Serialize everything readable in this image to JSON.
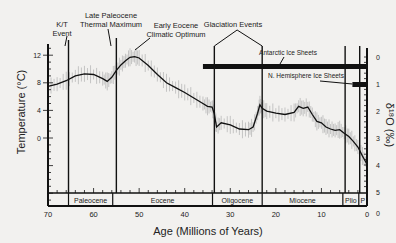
{
  "chart_data": {
    "type": "line",
    "title": "",
    "xlabel": "Age (Millions of Years)",
    "ylabel": "Temperature (°C)",
    "ylabel_right": "δ18O (‰)",
    "xlim": [
      70,
      0
    ],
    "ylim_left": [
      -8,
      14
    ],
    "ylim_right": [
      5,
      0
    ],
    "x_ticks": [
      70,
      60,
      50,
      40,
      30,
      20,
      10,
      0
    ],
    "y_ticks_left": [
      0,
      4,
      8,
      12
    ],
    "y_ticks_right": [
      0,
      1,
      2,
      3,
      4,
      5
    ],
    "grid": false,
    "series": [
      {
        "name": "Smoothed temperature",
        "x": [
          70,
          68,
          66,
          64,
          62,
          60,
          58,
          57,
          56,
          55,
          54,
          53,
          52,
          51,
          50,
          48,
          46,
          44,
          42,
          40,
          38,
          36,
          35,
          34,
          33.5,
          33,
          32,
          30,
          28,
          26,
          25,
          24,
          23.5,
          23,
          22,
          20,
          18,
          16,
          15,
          14,
          13,
          12,
          11,
          10,
          9,
          8,
          7,
          6,
          5,
          4,
          3,
          2,
          1,
          0
        ],
        "y": [
          7.5,
          7.8,
          8.3,
          9.0,
          9.3,
          9.2,
          8.6,
          8.2,
          8.8,
          9.8,
          10.6,
          11.2,
          11.7,
          11.8,
          11.6,
          10.5,
          9.2,
          8.0,
          7.3,
          6.6,
          5.8,
          5.0,
          4.6,
          4.5,
          3.5,
          1.6,
          2.2,
          1.9,
          1.3,
          1.2,
          1.6,
          3.6,
          4.8,
          4.3,
          3.9,
          3.6,
          3.4,
          3.7,
          4.6,
          4.3,
          4.5,
          3.4,
          2.4,
          2.2,
          1.6,
          1.3,
          1.1,
          1.2,
          0.7,
          0.2,
          -0.5,
          -1.3,
          -2.6,
          -3.8
        ]
      }
    ],
    "events": [
      {
        "label": "K/T Event",
        "age": 65.5
      },
      {
        "label": "Late Paleocene Thermal Maximum",
        "age": 55
      },
      {
        "label": "Early Eocene Climatic Optimum",
        "age": 51
      },
      {
        "label": "Glaciation Events",
        "ages": [
          33.5,
          23
        ]
      }
    ],
    "ice_sheets": [
      {
        "label": "Antarctic Ice Sheets",
        "from": 36,
        "to": 0
      },
      {
        "label": "N. Hemisphere Ice Sheets",
        "from": 3.2,
        "to": 0
      }
    ],
    "epochs": [
      {
        "label": "",
        "from": 70,
        "to": 65.5
      },
      {
        "label": "Paleocene",
        "from": 65.5,
        "to": 55.8
      },
      {
        "label": "Eocene",
        "from": 55.8,
        "to": 33.9
      },
      {
        "label": "Oligocene",
        "from": 33.9,
        "to": 23
      },
      {
        "label": "Miocene",
        "from": 23,
        "to": 5.3
      },
      {
        "label": "Plio",
        "from": 5.3,
        "to": 1.8
      },
      {
        "label": "P",
        "from": 1.8,
        "to": 0
      }
    ]
  },
  "labels": {
    "kt_event_1": "K/T",
    "kt_event_2": "Event",
    "lptm_1": "Late Paleocene",
    "lptm_2": "Thermal Maximum",
    "eeco_1": "Early Eocene",
    "eeco_2": "Climatic Optimum",
    "glaciation": "Glaciation Events",
    "antarctic": "Antarctic Ice Sheets",
    "nhemisphere": "N. Hemisphere Ice Sheets",
    "ylabel": "Temperature (°C)",
    "ylabel_right": "δ¹⁸O (‰)",
    "xlabel": "Age (Millions of Years)",
    "right_zero": "0"
  }
}
